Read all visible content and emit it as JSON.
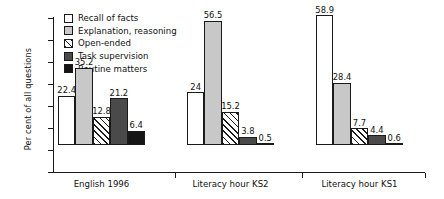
{
  "chart_data": {
    "type": "bar",
    "title": "",
    "xlabel": "",
    "ylabel": "Per cent of all questions",
    "ylim": [
      0,
      70
    ],
    "ytick_step": 10,
    "yticks": [
      "0",
      "10",
      "20",
      "30",
      "40",
      "50",
      "60",
      "70"
    ],
    "grid": false,
    "legend_position": "top-left",
    "categories": [
      "English 1996",
      "Literacy hour KS2",
      "Literacy hour KS1"
    ],
    "series": [
      {
        "name": "Recall of facts",
        "swatch": "white",
        "values": [
          22.4,
          24,
          58.9
        ],
        "labels": [
          "22.4",
          "24",
          "58.9"
        ]
      },
      {
        "name": "Explanation, reasoning",
        "swatch": "light-gray",
        "values": [
          35.2,
          56.5,
          28.4
        ],
        "labels": [
          "35.2",
          "56.5",
          "28.4"
        ]
      },
      {
        "name": "Open-ended",
        "swatch": "hatched",
        "values": [
          12.8,
          15.2,
          7.7
        ],
        "labels": [
          "12.8",
          "15.2",
          "7.7"
        ]
      },
      {
        "name": "Task supervision",
        "swatch": "dark-gray",
        "values": [
          21.2,
          3.8,
          4.4
        ],
        "labels": [
          "21.2",
          "3.8",
          "4.4"
        ]
      },
      {
        "name": "Routine matters",
        "swatch": "black",
        "values": [
          6.4,
          0.5,
          0.6
        ],
        "labels": [
          "6.4",
          "0.5",
          "0.6"
        ]
      }
    ],
    "colors": {
      "white": "#ffffff",
      "light_gray": "#c8c8c8",
      "dark_gray": "#4a4a4a",
      "black": "#151515",
      "outline": "#1a1a1a",
      "background": "#ffffff"
    }
  }
}
